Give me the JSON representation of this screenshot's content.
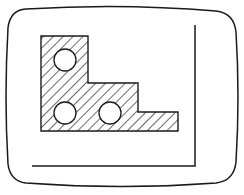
{
  "diagram": {
    "description": "Monitor screen outline containing a hatched stepped plate with three circular holes",
    "colors": {
      "background": "#ffffff",
      "stroke": "#1a1a1a",
      "hatch": "#1a1a1a",
      "hole_fill": "#ffffff"
    },
    "screen_frame": {
      "shape": "rounded-rectangle-bulged",
      "x": 8,
      "y": 8,
      "width": 229,
      "height": 180
    },
    "corner_guide": {
      "vertical_x": 195,
      "vertical_y_top": 25,
      "vertical_y_bottom": 166,
      "horizontal_y": 166,
      "horizontal_x_left": 32,
      "horizontal_x_right": 195
    },
    "plate": {
      "fill": "diagonal-hatch",
      "outline_points": [
        [
          41,
          36
        ],
        [
          88,
          36
        ],
        [
          88,
          83
        ],
        [
          138,
          83
        ],
        [
          138,
          112
        ],
        [
          178,
          112
        ],
        [
          178,
          131
        ],
        [
          41,
          131
        ]
      ]
    },
    "holes": [
      {
        "name": "hole-top-left",
        "cx": 65,
        "cy": 60,
        "r": 11
      },
      {
        "name": "hole-bottom-left",
        "cx": 65,
        "cy": 113,
        "r": 11
      },
      {
        "name": "hole-bottom-middle",
        "cx": 110,
        "cy": 113,
        "r": 11
      }
    ]
  }
}
